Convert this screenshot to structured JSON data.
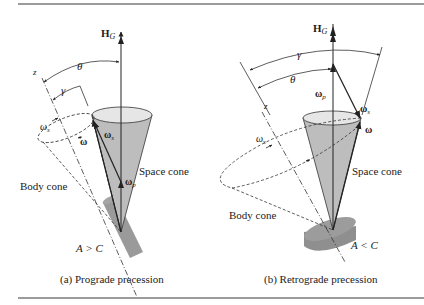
{
  "figure": {
    "panels": [
      {
        "id": "a",
        "caption": "(a) Prograde precession",
        "labels": {
          "angular_momentum": "H",
          "angular_momentum_sub": "G",
          "z_axis": "z",
          "theta": "θ",
          "gamma": "γ",
          "omega_s_italic": "ω",
          "omega_s_italic_sub": "s",
          "omega": "ω",
          "omega_s_bold": "ω",
          "omega_s_bold_sub": "s",
          "omega_p": "ω",
          "omega_p_sub": "p",
          "space_cone": "Space cone",
          "body_cone": "Body cone",
          "inertia_relation": "A > C"
        }
      },
      {
        "id": "b",
        "caption": "(b) Retrograde precession",
        "labels": {
          "angular_momentum": "H",
          "angular_momentum_sub": "G",
          "z_axis": "z",
          "theta": "θ",
          "gamma": "γ",
          "omega_s_italic": "ω",
          "omega_s_italic_sub": "s",
          "omega": "ω",
          "omega_s_bold": "ω",
          "omega_s_bold_sub": "s",
          "omega_p": "ω",
          "omega_p_sub": "p",
          "space_cone": "Space cone",
          "body_cone": "Body cone",
          "inertia_relation": "A < C"
        }
      }
    ],
    "colors": {
      "cone_fill": "#bdbdbd",
      "cylinder_fill": "#8f8f8f",
      "rule": "#7a7a7a",
      "ink": "#222222"
    }
  }
}
